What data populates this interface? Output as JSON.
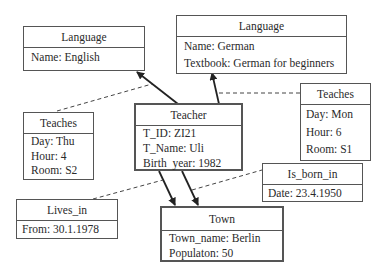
{
  "diagram": {
    "type": "object-relationship",
    "objects": [
      {
        "id": "language_english",
        "title": "Language",
        "attributes": [
          "Name: English"
        ]
      },
      {
        "id": "language_german",
        "title": "Language",
        "attributes": [
          "Name: German",
          "Textbook: German for beginners"
        ]
      },
      {
        "id": "teacher",
        "title": "Teacher",
        "attributes": [
          "T_ID: ZI21",
          "T_Name: Uli",
          "Birth  year: 1982"
        ]
      },
      {
        "id": "teaches_left",
        "title": "Teaches",
        "attributes": [
          "Day: Thu",
          "Hour: 4",
          "Room: S2"
        ]
      },
      {
        "id": "teaches_right",
        "title": "Teaches",
        "attributes": [
          "Day: Mon",
          "Hour: 6",
          "Room: S1"
        ]
      },
      {
        "id": "lives_in",
        "title": "Lives_in",
        "attributes": [
          "From: 30.1.1978"
        ]
      },
      {
        "id": "is_born_in",
        "title": "Is_born_in",
        "attributes": [
          "Date: 23.4.1950"
        ]
      },
      {
        "id": "town",
        "title": "Town",
        "attributes": [
          "Town_name: Berlin",
          "Populaton: 50"
        ]
      }
    ],
    "links": [
      {
        "from": "teacher",
        "to": "language_english",
        "style": "solid-arrow",
        "annotation": "teaches_left"
      },
      {
        "from": "teacher",
        "to": "language_german",
        "style": "solid-arrow",
        "annotation": "teaches_right"
      },
      {
        "from": "teacher",
        "to": "town",
        "style": "solid-arrow",
        "annotation": "lives_in"
      },
      {
        "from": "teacher",
        "to": "town",
        "style": "solid-arrow",
        "annotation": "is_born_in"
      }
    ]
  }
}
